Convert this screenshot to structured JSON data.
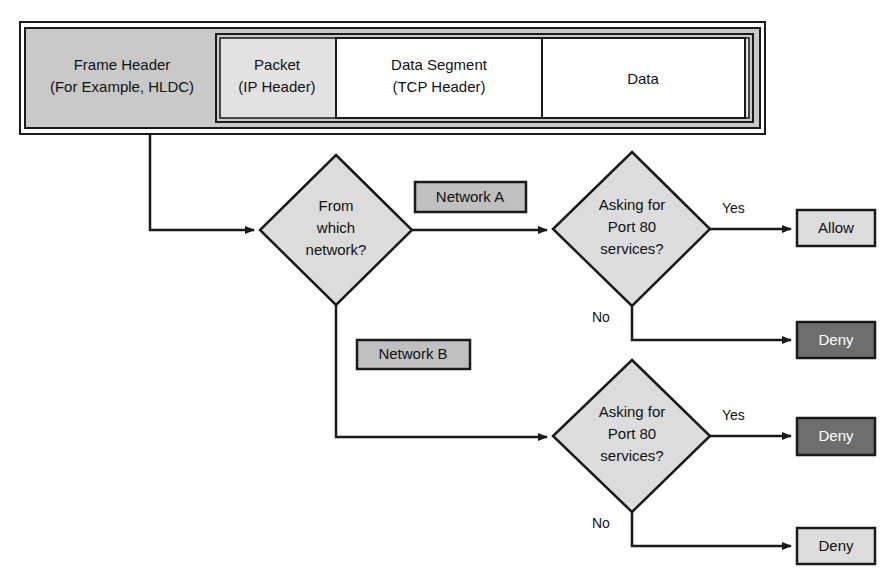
{
  "diagram": {
    "colors": {
      "frame_gray": "#c9c9c9",
      "light_gray": "#dcdcdc",
      "mid_gray": "#c0c0c0",
      "dark_gray": "#6e6e6e",
      "white": "#ffffff",
      "stroke": "#1a1a1a"
    },
    "frame": {
      "header": {
        "line1": "Frame Header",
        "line2": "(For Example, HLDC)"
      },
      "packet": {
        "line1": "Packet",
        "line2": "(IP Header)"
      },
      "segment": {
        "line1": "Data Segment",
        "line2": "(TCP Header)"
      },
      "data": {
        "line1": "Data"
      }
    },
    "decisions": {
      "network": {
        "line1": "From",
        "line2": "which",
        "line3": "network?"
      },
      "port_top": {
        "line1": "Asking for",
        "line2": "Port 80",
        "line3": "services?"
      },
      "port_bottom": {
        "line1": "Asking for",
        "line2": "Port 80",
        "line3": "services?"
      }
    },
    "branch_labels": {
      "network_a": "Network A",
      "network_b": "Network B",
      "yes_top": "Yes",
      "no_top": "No",
      "yes_bottom": "Yes",
      "no_bottom": "No"
    },
    "results": {
      "allow_top": "Allow",
      "deny_top": "Deny",
      "deny_mid": "Deny",
      "deny_bottom": "Deny"
    }
  }
}
